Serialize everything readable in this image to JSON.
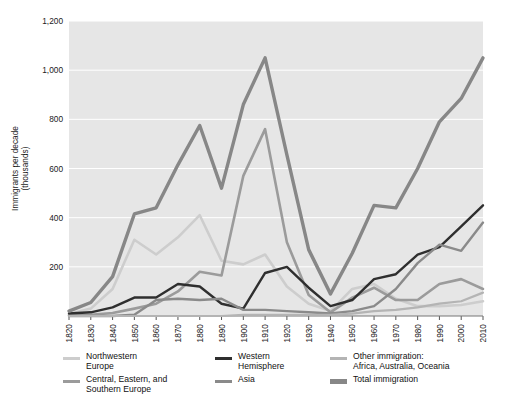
{
  "chart_data": {
    "type": "line",
    "title": "",
    "xlabel": "",
    "ylabel": "Immigrants per decade\n(thousands)",
    "ylabel_line1": "Immigrants per decade",
    "ylabel_line2": "(thousands)",
    "xlim": [
      1820,
      2010
    ],
    "ylim": [
      0,
      1200
    ],
    "yticks": [
      0,
      200,
      400,
      600,
      800,
      1000,
      1200
    ],
    "ytick_labels": [
      "",
      "200",
      "400",
      "600",
      "800",
      "1,000",
      "1,200"
    ],
    "grid": "horizontal",
    "plot_background": "#e6e6e6",
    "gridline_color": "#ffffff",
    "legend_position": "bottom",
    "x": [
      1820,
      1830,
      1840,
      1850,
      1860,
      1870,
      1880,
      1890,
      1900,
      1910,
      1920,
      1930,
      1940,
      1950,
      1960,
      1970,
      1980,
      1990,
      2000,
      2010
    ],
    "categories": [
      "1820",
      "1830",
      "1840",
      "1850",
      "1860",
      "1870",
      "1880",
      "1890",
      "1900",
      "1910",
      "1920",
      "1930",
      "1940",
      "1950",
      "1960",
      "1970",
      "1980",
      "1990",
      "2000",
      "2010"
    ],
    "series": [
      {
        "name": "Northwestern Europe",
        "color": "#cdcdcd",
        "width": 2.6,
        "values": [
          8,
          30,
          110,
          310,
          250,
          320,
          410,
          225,
          210,
          250,
          120,
          50,
          20,
          110,
          130,
          70,
          40,
          40,
          45,
          60
        ]
      },
      {
        "name": "Central, Eastern, and Southern Europe",
        "color": "#9b9b9b",
        "width": 2.6,
        "values": [
          3,
          5,
          12,
          30,
          50,
          100,
          180,
          165,
          570,
          760,
          300,
          85,
          15,
          75,
          115,
          65,
          65,
          130,
          150,
          110
        ]
      },
      {
        "name": "Western Hemisphere",
        "color": "#2f2f2f",
        "width": 2.4,
        "values": [
          10,
          15,
          35,
          75,
          75,
          130,
          120,
          50,
          30,
          175,
          200,
          115,
          40,
          65,
          150,
          170,
          250,
          280,
          365,
          450
        ]
      },
      {
        "name": "Asia",
        "color": "#8a8a8a",
        "width": 2.4,
        "values": [
          0,
          0,
          0,
          5,
          65,
          70,
          65,
          70,
          25,
          25,
          20,
          15,
          10,
          20,
          40,
          110,
          215,
          290,
          265,
          380
        ]
      },
      {
        "name": "Other immigration: Africa, Australia, Oceania",
        "color": "#b4b4b4",
        "width": 2.2,
        "values": [
          0,
          0,
          0,
          0,
          0,
          0,
          0,
          0,
          5,
          5,
          5,
          5,
          5,
          10,
          20,
          25,
          35,
          50,
          60,
          95
        ]
      },
      {
        "name": "Total immigration",
        "color": "#878787",
        "width": 3.4,
        "values": [
          20,
          55,
          160,
          415,
          440,
          615,
          775,
          520,
          860,
          1050,
          655,
          270,
          90,
          255,
          450,
          440,
          600,
          790,
          885,
          1050
        ]
      }
    ]
  },
  "legend": {
    "columns": [
      {
        "entries": [
          {
            "label": "Northwestern\nEurope",
            "color": "#cdcdcd",
            "thick": false,
            "name": "northwestern-europe"
          },
          {
            "label": "Central, Eastern, and\nSouthern Europe",
            "color": "#9b9b9b",
            "thick": false,
            "name": "central-eastern-southern-europe"
          }
        ]
      },
      {
        "entries": [
          {
            "label": "Western\nHemisphere",
            "color": "#2f2f2f",
            "thick": false,
            "name": "western-hemisphere"
          },
          {
            "label": "Asia",
            "color": "#8a8a8a",
            "thick": false,
            "name": "asia"
          }
        ]
      },
      {
        "entries": [
          {
            "label": "Other immigration:\nAfrica, Australia, Oceania",
            "color": "#b4b4b4",
            "thick": false,
            "name": "other-immigration"
          },
          {
            "label": "Total immigration",
            "color": "#878787",
            "thick": true,
            "name": "total-immigration"
          }
        ]
      }
    ]
  }
}
